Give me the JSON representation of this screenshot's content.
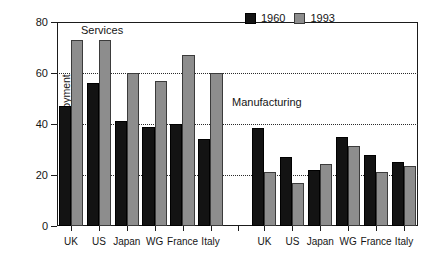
{
  "chart_data": {
    "type": "bar",
    "title": "",
    "xlabel": "",
    "ylabel": "% of civilian employment",
    "ylim": [
      0,
      80
    ],
    "yticks": [
      0,
      20,
      40,
      60,
      80
    ],
    "ytick_labels": [
      "0",
      "20",
      "40",
      "60",
      "80"
    ],
    "grid": "horizontal dotted gridlines at 20, 40, 60, 80",
    "legend_position": "top-right inside plot",
    "categories": [
      "UK",
      "US",
      "Japan",
      "WG",
      "France",
      "Italy"
    ],
    "panels": [
      {
        "name": "Services",
        "series": [
          {
            "name": "1960",
            "color": "#131313",
            "values": [
              47,
              56,
              41,
              39,
              40,
              34
            ]
          },
          {
            "name": "1993",
            "color": "#8d8d8d",
            "values": [
              73,
              73,
              60,
              57,
              67,
              60
            ]
          }
        ]
      },
      {
        "name": "Manufacturing",
        "series": [
          {
            "name": "1960",
            "color": "#131313",
            "values": [
              38.5,
              27,
              22,
              35,
              28,
              25
            ]
          },
          {
            "name": "1993",
            "color": "#8d8d8d",
            "values": [
              21,
              17,
              24.5,
              31.5,
              21,
              23.5
            ]
          }
        ]
      }
    ],
    "annotations": [
      "Services",
      "Manufacturing"
    ]
  },
  "legend": {
    "items": [
      {
        "label": "1960",
        "color": "#131313"
      },
      {
        "label": "1993",
        "color": "#8d8d8d"
      }
    ]
  },
  "axis": {
    "y_title": "% of civilian employment"
  },
  "caption": ""
}
